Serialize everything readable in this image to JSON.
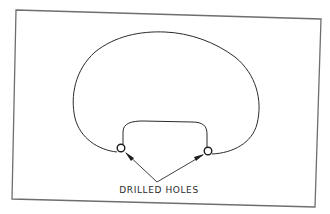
{
  "figure": {
    "type": "technical-drawing"
  },
  "labels": {
    "drilled_holes": "DRILLED HOLES"
  },
  "colors": {
    "background": "#ffffff",
    "frame": "#6e6e6e",
    "line": "#2b2b2b"
  },
  "callouts": [
    {
      "target": "left-drilled-hole",
      "label_ref": "drilled_holes"
    },
    {
      "target": "right-drilled-hole",
      "label_ref": "drilled_holes"
    }
  ]
}
